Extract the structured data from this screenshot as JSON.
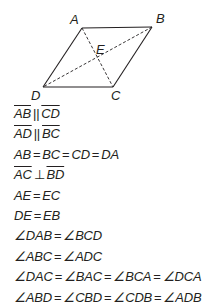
{
  "figure": {
    "type": "rhombus",
    "vertices": {
      "A": {
        "label": "A",
        "x": 82,
        "y": 28
      },
      "B": {
        "label": "B",
        "x": 152,
        "y": 27
      },
      "C": {
        "label": "C",
        "x": 113,
        "y": 87
      },
      "D": {
        "label": "D",
        "x": 43,
        "y": 87
      },
      "E": {
        "label": "E",
        "x": 98,
        "y": 57
      }
    },
    "sides": [
      "AB",
      "BC",
      "CD",
      "DA"
    ],
    "diagonals_dashed": [
      "AC",
      "BD"
    ],
    "line_color": "#231f20"
  },
  "statements": [
    {
      "parts": [
        {
          "seg": "AB"
        },
        {
          "op": "||"
        },
        {
          "seg": "CD"
        }
      ]
    },
    {
      "parts": [
        {
          "seg": "AD"
        },
        {
          "op": "||"
        },
        {
          "seg": "BC"
        }
      ]
    },
    {
      "parts": [
        {
          "t": "AB"
        },
        {
          "op": "="
        },
        {
          "t": "BC"
        },
        {
          "op": "="
        },
        {
          "t": "CD"
        },
        {
          "op": "="
        },
        {
          "t": "DA"
        }
      ]
    },
    {
      "parts": [
        {
          "seg": "AC"
        },
        {
          "op": "⊥"
        },
        {
          "seg": "BD"
        }
      ]
    },
    {
      "parts": [
        {
          "t": "AE"
        },
        {
          "op": "="
        },
        {
          "t": "EC"
        }
      ]
    },
    {
      "parts": [
        {
          "t": "DE"
        },
        {
          "op": "="
        },
        {
          "t": "EB"
        }
      ]
    },
    {
      "parts": [
        {
          "t": "∠DAB"
        },
        {
          "op": "="
        },
        {
          "t": "∠BCD"
        }
      ]
    },
    {
      "parts": [
        {
          "t": "∠ABC"
        },
        {
          "op": "="
        },
        {
          "t": "∠ADC"
        }
      ]
    },
    {
      "parts": [
        {
          "t": "∠DAC"
        },
        {
          "op": "="
        },
        {
          "t": "∠BAC"
        },
        {
          "op": "="
        },
        {
          "t": "∠BCA"
        },
        {
          "op": "="
        },
        {
          "t": "∠DCA"
        }
      ]
    },
    {
      "parts": [
        {
          "t": "∠ABD"
        },
        {
          "op": "="
        },
        {
          "t": "∠CBD"
        },
        {
          "op": "="
        },
        {
          "t": "∠CDB"
        },
        {
          "op": "="
        },
        {
          "t": "∠ADB"
        }
      ]
    }
  ]
}
